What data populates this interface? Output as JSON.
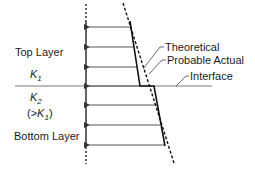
{
  "diagram": {
    "layers": {
      "top": {
        "name": "Top Layer",
        "k_symbol": "K",
        "k_sub": "1"
      },
      "bottom": {
        "name": "Bottom Layer",
        "k_symbol": "K",
        "k_sub": "2",
        "relation_open": "(>",
        "relation_k": "K",
        "relation_sub": "1",
        "relation_close": ")"
      }
    },
    "annotations": {
      "theoretical": "Theoretical",
      "probable_actual": "Probable Actual",
      "interface": "Interface"
    },
    "colors": {
      "line": "#1a1a1a",
      "arrow": "#555555",
      "background": "#ffffff"
    }
  }
}
